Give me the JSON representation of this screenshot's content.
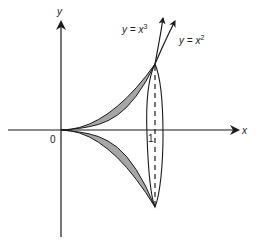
{
  "diagram": {
    "type": "volume-of-revolution",
    "axes": {
      "x_label": "x",
      "y_label": "y",
      "origin_label": "0",
      "tick_label_x": "1"
    },
    "curves": [
      {
        "name": "cubic",
        "label_lhs": "y = x",
        "label_exp": "3",
        "equation": "y = x^3"
      },
      {
        "name": "quadratic",
        "label_lhs": "y = x",
        "label_exp": "2",
        "equation": "y = x^2"
      }
    ],
    "region": {
      "description": "Region between y = x^2 and y = x^3 from x = 0 to x = 1, shaded and reflected about the x-axis (solid of revolution)",
      "fill": "#a6a6a6"
    },
    "cross_section": {
      "shape": "ellipse",
      "at_x": "1",
      "axis_line": "dashed"
    },
    "colors": {
      "stroke": "#1a1a1a",
      "shade": "#a6a6a6",
      "background": "#ffffff"
    }
  }
}
